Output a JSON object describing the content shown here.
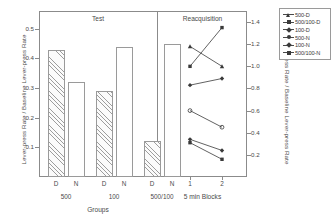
{
  "chart_data": {
    "type": "bar",
    "title": "",
    "panels": [
      {
        "name": "test-panel",
        "title": "Test",
        "type": "bar",
        "xlabel": "Groups",
        "ylabel": "Lever-press Rate / Baseline Lever-press Rate",
        "ylim": [
          0,
          0.56
        ],
        "yticks": [
          0.1,
          0.2,
          0.3,
          0.4,
          0.5
        ],
        "ytick_labels": [
          "0.1",
          "0.2",
          "0.3",
          "0.4",
          "0.5"
        ],
        "categories": [
          "500",
          "100",
          "500/100"
        ],
        "subcategories": [
          "D",
          "N"
        ],
        "bars": [
          {
            "group": "500",
            "condition": "D",
            "value": 0.43,
            "fill": "hatched"
          },
          {
            "group": "500",
            "condition": "N",
            "value": 0.32,
            "fill": "open"
          },
          {
            "group": "100",
            "condition": "D",
            "value": 0.29,
            "fill": "hatched"
          },
          {
            "group": "100",
            "condition": "N",
            "value": 0.44,
            "fill": "open"
          },
          {
            "group": "500/100",
            "condition": "D",
            "value": 0.12,
            "fill": "hatched"
          },
          {
            "group": "500/100",
            "condition": "N",
            "value": 0.45,
            "fill": "open"
          }
        ]
      },
      {
        "name": "reacquisition-panel",
        "title": "Reacquisition",
        "type": "line",
        "xlabel": "5 min Blocks",
        "ylabel": "Lever-press Rate / Baseline Lever-press Rate",
        "x": [
          1,
          2
        ],
        "xtick_labels": [
          "1",
          "2"
        ],
        "ylim": [
          0,
          1.5
        ],
        "yticks": [
          0.2,
          0.4,
          0.6,
          0.8,
          1.0,
          1.2,
          1.4
        ],
        "ytick_labels": [
          "0.2",
          "0.4",
          "0.6",
          "0.8",
          "1.0",
          "1.2",
          "1.4"
        ],
        "series": [
          {
            "name": "500-D",
            "marker": "triangle",
            "values": [
              1.18,
              1.0
            ]
          },
          {
            "name": "500/100-D",
            "marker": "square",
            "values": [
              1.0,
              1.35
            ]
          },
          {
            "name": "100-D",
            "marker": "diamond",
            "values": [
              0.83,
              0.89
            ]
          },
          {
            "name": "500-N",
            "marker": "circle",
            "values": [
              0.6,
              0.45
            ]
          },
          {
            "name": "100-N",
            "marker": "diamond",
            "values": [
              0.34,
              0.24
            ]
          },
          {
            "name": "500/100-N",
            "marker": "square",
            "values": [
              0.31,
              0.16
            ]
          }
        ]
      }
    ],
    "legend": {
      "position": "right-outside",
      "entries": [
        {
          "label": "500-D",
          "marker": "triangle"
        },
        {
          "label": "500/100-D",
          "marker": "square"
        },
        {
          "label": "100-D",
          "marker": "diamond"
        },
        {
          "label": "500-N",
          "marker": "circle"
        },
        {
          "label": "100-N",
          "marker": "diamond"
        },
        {
          "label": "500/100-N",
          "marker": "square"
        }
      ]
    },
    "colors": {
      "line": "#3a3a3a",
      "axis": "#8b8b8b",
      "text": "#4a4a4a",
      "background": "#ffffff"
    }
  }
}
